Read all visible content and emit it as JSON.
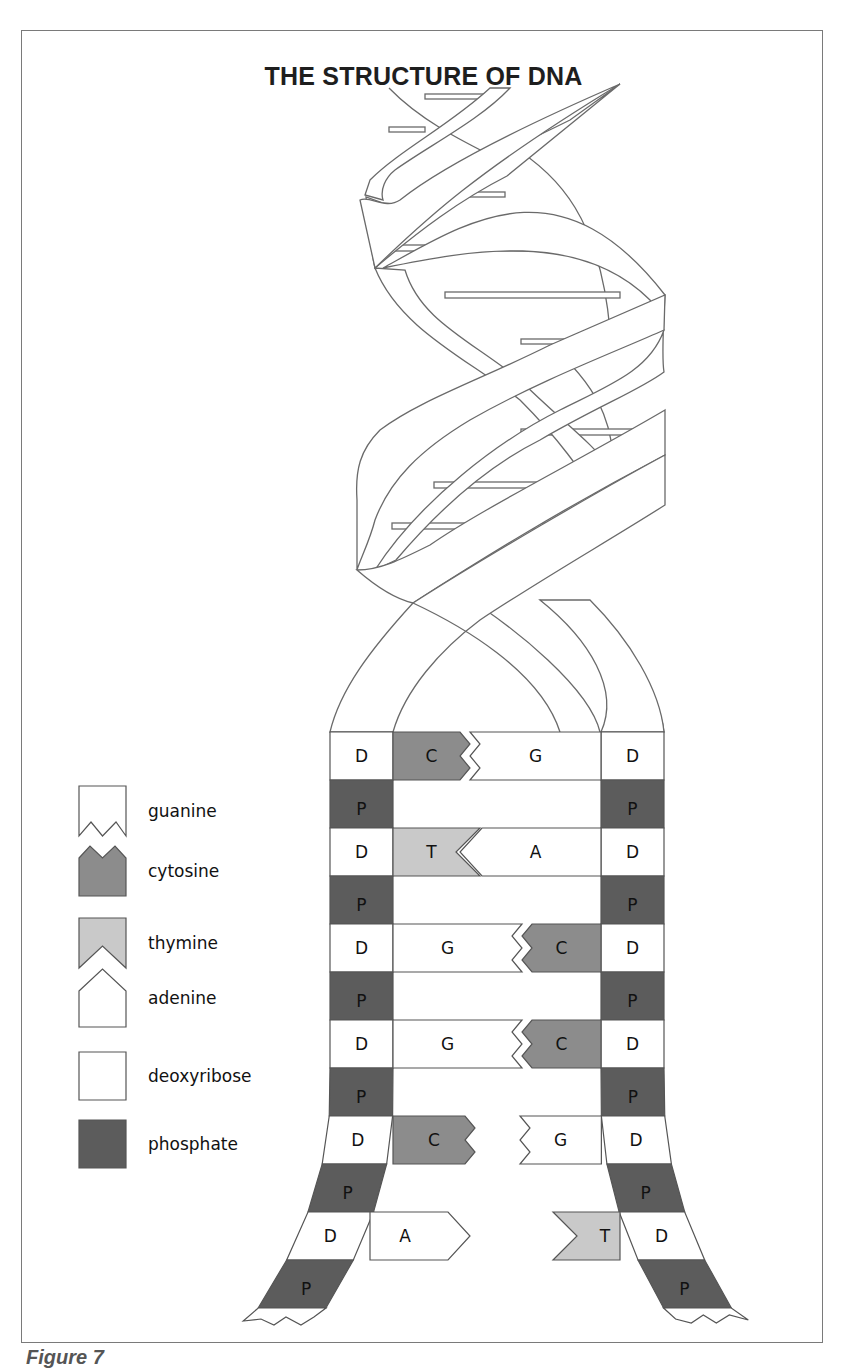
{
  "title": "THE STRUCTURE OF DNA",
  "caption": "Figure 7",
  "colors": {
    "cytosine": "#8c8c8c",
    "thymine": "#c9c9c9",
    "guanine": "#ffffff",
    "adenine": "#ffffff",
    "deoxyribose": "#ffffff",
    "phosphate": "#5c5c5c",
    "outline": "#555555"
  },
  "legend": [
    {
      "key": "guanine",
      "label": "guanine",
      "shape": "guanine-shape"
    },
    {
      "key": "cytosine",
      "label": "cytosine",
      "shape": "cytosine-shape"
    },
    {
      "key": "thymine",
      "label": "thymine",
      "shape": "thymine-shape"
    },
    {
      "key": "adenine",
      "label": "adenine",
      "shape": "adenine-shape"
    },
    {
      "key": "deoxyribose",
      "label": "deoxyribose",
      "shape": "square"
    },
    {
      "key": "phosphate",
      "label": "phosphate",
      "shape": "square"
    }
  ],
  "backbone_labels": {
    "deoxyribose": "D",
    "phosphate": "P"
  },
  "base_pairs": [
    {
      "left": "C",
      "right": "G",
      "bonded": true
    },
    {
      "left": "T",
      "right": "A",
      "bonded": true
    },
    {
      "left": "G",
      "right": "C",
      "bonded": true
    },
    {
      "left": "G",
      "right": "C",
      "bonded": true
    },
    {
      "left": "C",
      "right": "G",
      "bonded": false
    },
    {
      "left": "A",
      "right": "T",
      "bonded": false
    }
  ]
}
